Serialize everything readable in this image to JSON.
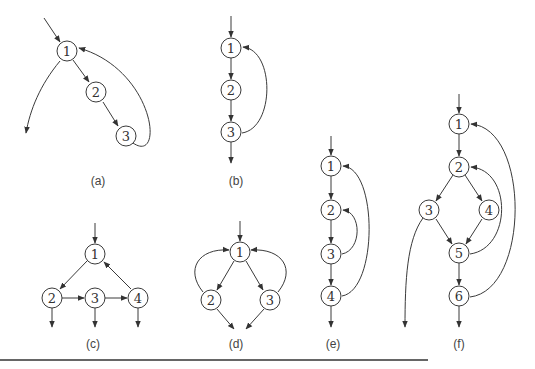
{
  "figure": {
    "panels": [
      {
        "id": "a",
        "caption": "(a)",
        "nodes": [
          {
            "label": "1",
            "x": 67,
            "y": 51
          },
          {
            "label": "2",
            "x": 96,
            "y": 92
          },
          {
            "label": "3",
            "x": 126,
            "y": 136
          }
        ]
      },
      {
        "id": "b",
        "caption": "(b)",
        "nodes": [
          {
            "label": "1",
            "x": 231,
            "y": 48
          },
          {
            "label": "2",
            "x": 231,
            "y": 90
          },
          {
            "label": "3",
            "x": 231,
            "y": 132
          }
        ]
      },
      {
        "id": "c",
        "caption": "(c)",
        "nodes": [
          {
            "label": "1",
            "x": 95,
            "y": 254
          },
          {
            "label": "2",
            "x": 52,
            "y": 298
          },
          {
            "label": "3",
            "x": 95,
            "y": 298
          },
          {
            "label": "4",
            "x": 138,
            "y": 298
          }
        ]
      },
      {
        "id": "d",
        "caption": "(d)",
        "nodes": [
          {
            "label": "1",
            "x": 240,
            "y": 252
          },
          {
            "label": "2",
            "x": 211,
            "y": 300
          },
          {
            "label": "3",
            "x": 270,
            "y": 300
          }
        ]
      },
      {
        "id": "e",
        "caption": "(e)",
        "nodes": [
          {
            "label": "1",
            "x": 331,
            "y": 166
          },
          {
            "label": "2",
            "x": 331,
            "y": 210
          },
          {
            "label": "3",
            "x": 331,
            "y": 254
          },
          {
            "label": "4",
            "x": 331,
            "y": 296
          }
        ]
      },
      {
        "id": "f",
        "caption": "(f)",
        "nodes": [
          {
            "label": "1",
            "x": 459,
            "y": 124
          },
          {
            "label": "2",
            "x": 459,
            "y": 167
          },
          {
            "label": "3",
            "x": 429,
            "y": 210
          },
          {
            "label": "4",
            "x": 489,
            "y": 210
          },
          {
            "label": "5",
            "x": 459,
            "y": 253
          },
          {
            "label": "6",
            "x": 459,
            "y": 296
          }
        ]
      }
    ]
  }
}
